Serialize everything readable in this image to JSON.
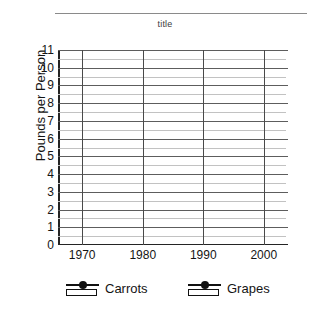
{
  "chart_data": {
    "type": "line",
    "title": "title",
    "xlabel": "",
    "ylabel": "Pounds per Person",
    "xlim": [
      1966,
      2004
    ],
    "ylim": [
      0,
      11
    ],
    "grid": true,
    "legend_position": "bottom",
    "x_ticks": [
      "1970",
      "1980",
      "1990",
      "2000"
    ],
    "x_tick_values": [
      1970,
      1980,
      1990,
      2000
    ],
    "y_ticks": [
      "0",
      "1",
      "2",
      "3",
      "4",
      "5",
      "6",
      "7",
      "8",
      "9",
      "10",
      "11"
    ],
    "y_tick_values": [
      0,
      1,
      2,
      3,
      4,
      5,
      6,
      7,
      8,
      9,
      10,
      11
    ],
    "y_minor_step": 0.5,
    "series": [
      {
        "name": "Carrots",
        "values": [],
        "x": []
      },
      {
        "name": "Grapes",
        "values": [],
        "x": []
      }
    ],
    "note": "Empty plotting grid; no data points are drawn for either series."
  },
  "legend": {
    "entries": [
      {
        "label": "Carrots",
        "marker": "line-with-dot-over-box"
      },
      {
        "label": "Grapes",
        "marker": "line-with-dot-over-box"
      }
    ]
  },
  "colors": {
    "background": "#ffffff",
    "major_gridline": "#5d5d5d",
    "minor_gridline": "#c2c2c2",
    "axis": "#242424",
    "text": "#141414",
    "title_rule": "#8a8a8a"
  }
}
